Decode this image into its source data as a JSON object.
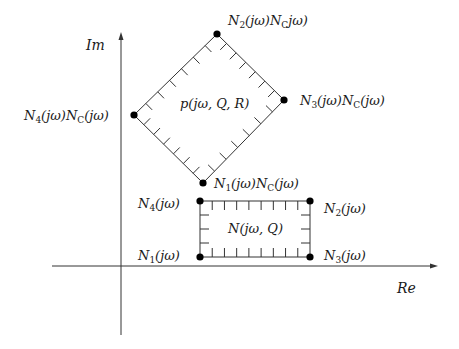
{
  "diagram": {
    "type": "complex-plane-value-sets",
    "colors": {
      "line": "#333333",
      "dot": "#000000",
      "text": "#1a1a1a",
      "background": "#ffffff"
    },
    "axes": {
      "x_label": "Re",
      "y_label": "Im",
      "x_axis": {
        "x1": 52,
        "x2": 438,
        "y": 266
      },
      "y_axis": {
        "x": 121,
        "y1": 335,
        "y2": 32
      }
    },
    "diamond": {
      "label": "p(jω, Q, R)",
      "vertices": {
        "top": {
          "x": 217,
          "y": 34,
          "label_base": "N",
          "label_sub": "2",
          "label_rest": "(jω)N",
          "label_sub2": "C",
          "label_tail": "jω)"
        },
        "right": {
          "x": 284,
          "y": 100,
          "label_base": "N",
          "label_sub": "3",
          "label_rest": "(jω)N",
          "label_sub2": "C",
          "label_tail": "(jω)"
        },
        "left": {
          "x": 134,
          "y": 115,
          "label_base": "N",
          "label_sub": "4",
          "label_rest": "(jω)N",
          "label_sub2": "C",
          "label_tail": "(jω)"
        },
        "bottom": {
          "x": 203,
          "y": 183,
          "label_base": "N",
          "label_sub": "1",
          "label_rest": "(jω)N",
          "label_sub2": "C",
          "label_tail": "(jω)"
        }
      },
      "ticks_per_edge": 6
    },
    "rectangle": {
      "label": "N(jω, Q)",
      "x1": 200,
      "y1": 201,
      "x2": 310,
      "y2": 257,
      "corners": {
        "top_left": {
          "label_base": "N",
          "label_sub": "4",
          "label_tail": "(jω)"
        },
        "top_right": {
          "label_base": "N",
          "label_sub": "2",
          "label_tail": "(jω)"
        },
        "bottom_left": {
          "label_base": "N",
          "label_sub": "1",
          "label_tail": "(jω)"
        },
        "bottom_right": {
          "label_base": "N",
          "label_sub": "3",
          "label_tail": "(jω)"
        }
      },
      "ticks_horizontal_edge": 8,
      "ticks_vertical_edge": 3
    }
  }
}
